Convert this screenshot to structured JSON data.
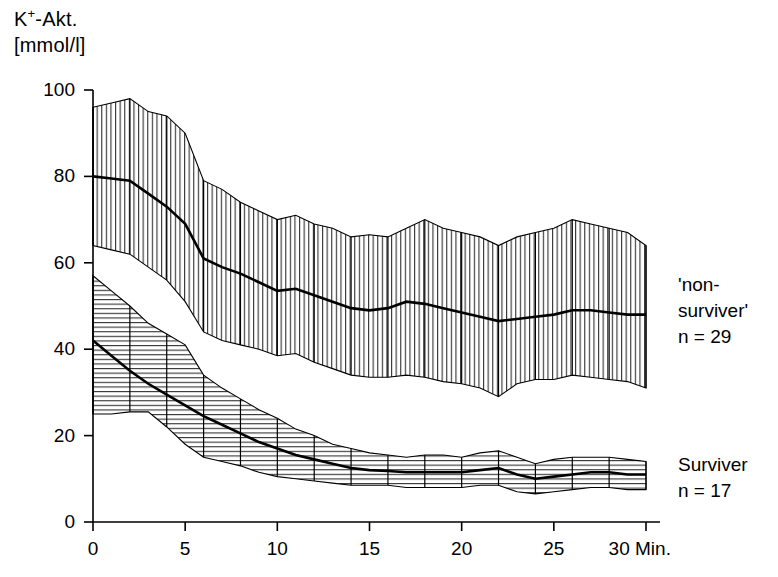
{
  "chart_data": {
    "type": "line",
    "title": "",
    "xlabel": "Min.",
    "ylabel_line1": "K+-Akt.",
    "ylabel_line2": "[mmol/l]",
    "ylabel_superscript": "+",
    "ylabel_base": "K",
    "ylabel_rest": "-Akt.",
    "xlim": [
      0,
      30
    ],
    "ylim": [
      0,
      100
    ],
    "xticks": [
      0,
      5,
      10,
      15,
      20,
      25,
      30
    ],
    "xticklabels": [
      "0",
      "5",
      "10",
      "15",
      "20",
      "25",
      "30"
    ],
    "xunit": "Min.",
    "yticks": [
      0,
      20,
      40,
      60,
      80,
      100
    ],
    "yticklabels": [
      "0",
      "20",
      "40",
      "60",
      "80",
      "100"
    ],
    "grid": false,
    "legend_position": "right-inline",
    "x": [
      0,
      1,
      2,
      3,
      4,
      5,
      6,
      7,
      8,
      9,
      10,
      11,
      12,
      13,
      14,
      15,
      16,
      17,
      18,
      19,
      20,
      21,
      22,
      23,
      24,
      25,
      26,
      27,
      28,
      29,
      30
    ],
    "series": [
      {
        "name": "'non-surviver'",
        "n": 29,
        "hatch": "vertical",
        "values": [
          80,
          79.5,
          79,
          76,
          73,
          69,
          61,
          59,
          57.5,
          55.5,
          53.5,
          54,
          52.5,
          51,
          49.5,
          49,
          49.5,
          51,
          50.5,
          49.5,
          48.5,
          47.5,
          46.5,
          47,
          47.5,
          48,
          49,
          49,
          48.5,
          48,
          48
        ],
        "upper": [
          96,
          97,
          98,
          95,
          94,
          90,
          79,
          77,
          74,
          72,
          70,
          71,
          69,
          68,
          66,
          66.5,
          66,
          68,
          70,
          68,
          67,
          66,
          64,
          66,
          67,
          68,
          70,
          69,
          68,
          67,
          64
        ],
        "lower": [
          64,
          63,
          62,
          59,
          56,
          51,
          44,
          42,
          41,
          40,
          38.5,
          39,
          37,
          35.5,
          34,
          33.5,
          33.5,
          34,
          33.5,
          32.5,
          32,
          31,
          29,
          32,
          33,
          33,
          34,
          33.5,
          33,
          32.5,
          31
        ]
      },
      {
        "name": "Surviver",
        "n": 17,
        "hatch": "horizontal",
        "values": [
          42,
          38.5,
          35,
          32,
          29.5,
          27,
          24.5,
          22.5,
          20.5,
          18.5,
          17,
          15.5,
          14.5,
          13.5,
          12.5,
          12,
          11.8,
          11.5,
          11.5,
          11.5,
          11.5,
          12,
          12.5,
          11,
          10,
          10.5,
          11,
          11.5,
          11.5,
          11,
          11
        ],
        "upper": [
          57,
          53.5,
          50,
          46,
          43.5,
          41,
          34,
          31,
          28.5,
          26,
          24,
          21.5,
          20,
          18,
          17,
          16,
          15.5,
          15,
          15.5,
          15.5,
          15,
          16,
          16.5,
          15,
          13.5,
          14.5,
          15,
          15,
          15,
          14.5,
          14
        ],
        "lower": [
          25,
          25,
          25.5,
          25.5,
          22,
          18,
          15,
          14,
          13,
          11.5,
          10.5,
          10,
          9.5,
          9,
          8.5,
          8.5,
          8.5,
          8,
          8,
          8,
          8,
          8.5,
          8.5,
          7,
          6.5,
          7,
          7.5,
          8,
          8,
          7.5,
          7.5
        ]
      }
    ],
    "errorbar_interval_minutes": 2,
    "annotations": [
      {
        "id": "nonsurviver",
        "line1": "'non-",
        "line2": "surviver'",
        "line3": "n = 29"
      },
      {
        "id": "surviver",
        "line1": "Surviver",
        "line2": "n = 17"
      }
    ]
  },
  "labels": {
    "y_axis_k": "K",
    "y_axis_plus": "+",
    "y_axis_akt": "-Akt.",
    "y_axis_unit": "[mmol/l]",
    "x_unit": "Min."
  },
  "colors": {
    "ink": "#000000",
    "background": "#ffffff",
    "hatch": "#1a1a1a"
  }
}
